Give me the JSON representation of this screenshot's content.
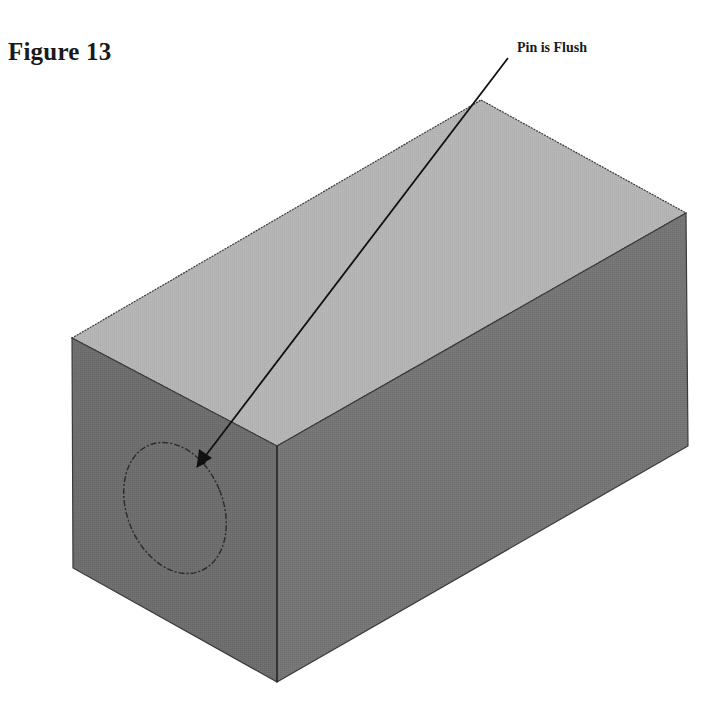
{
  "figure": {
    "title": "Figure 13",
    "callout_label": "Pin is Flush"
  },
  "drawing": {
    "type": "isometric-block",
    "colors": {
      "top_face": "#b6b6b6",
      "left_face": "#6f6f6f",
      "right_face": "#777777",
      "edge": "#3a3a3a",
      "pin_outline": "#2a2a2a",
      "arrow": "#111111"
    },
    "vertices": {
      "top_back": [
        481,
        100
      ],
      "top_right": [
        686,
        213
      ],
      "top_left": [
        72,
        338
      ],
      "top_front": [
        277,
        446
      ],
      "bottom_right": [
        688,
        446
      ],
      "bottom_front": [
        277,
        682
      ],
      "bottom_left": [
        73,
        568
      ]
    },
    "pin": {
      "center": [
        175,
        508
      ],
      "rx": 48,
      "ry": 68,
      "rotation": -22
    },
    "arrow": {
      "from": [
        508,
        58
      ],
      "to": [
        197,
        467
      ]
    }
  }
}
